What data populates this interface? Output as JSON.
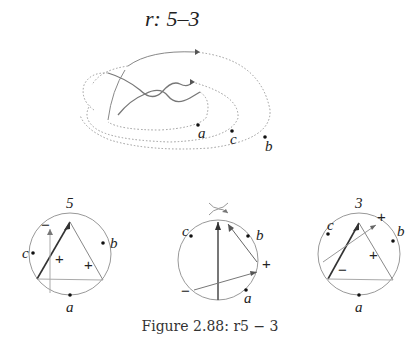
{
  "title": "r: 5–3",
  "caption": "Figure 2.88: r5 − 3",
  "knot": {
    "points": [
      {
        "label": "a",
        "x": 198,
        "y": 125
      },
      {
        "label": "c",
        "x": 232,
        "y": 131
      },
      {
        "label": "b",
        "x": 265,
        "y": 137
      }
    ]
  },
  "diagrams": [
    {
      "name": "5",
      "cx": 70,
      "cy": 254,
      "r": 41,
      "points": [
        {
          "label": "c",
          "x": 33,
          "y": 253
        },
        {
          "label": "b",
          "x": 103,
          "y": 243
        },
        {
          "label": "a",
          "x": 70,
          "y": 300
        }
      ],
      "signs": [
        {
          "text": "−",
          "x": 41,
          "y": 230
        },
        {
          "text": "+",
          "x": 56,
          "y": 264
        },
        {
          "text": "+",
          "x": 85,
          "y": 270
        }
      ]
    },
    {
      "name": "crossing",
      "cx": 218,
      "cy": 260,
      "r": 40,
      "points": [
        {
          "label": "c",
          "x": 191,
          "y": 236
        },
        {
          "label": "b",
          "x": 248,
          "y": 236
        },
        {
          "label": "a",
          "x": 246,
          "y": 290
        }
      ],
      "signs": [
        {
          "text": "+",
          "x": 262,
          "y": 269
        },
        {
          "text": "−",
          "x": 182,
          "y": 296
        }
      ]
    },
    {
      "name": "3",
      "cx": 359,
      "cy": 254,
      "r": 41,
      "points": [
        {
          "label": "c",
          "x": 328,
          "y": 234
        },
        {
          "label": "b",
          "x": 394,
          "y": 241
        },
        {
          "label": "a",
          "x": 359,
          "y": 300
        }
      ],
      "signs": [
        {
          "text": "+",
          "x": 378,
          "y": 222
        },
        {
          "text": "+",
          "x": 371,
          "y": 260
        },
        {
          "text": "−",
          "x": 340,
          "y": 275
        }
      ]
    }
  ]
}
